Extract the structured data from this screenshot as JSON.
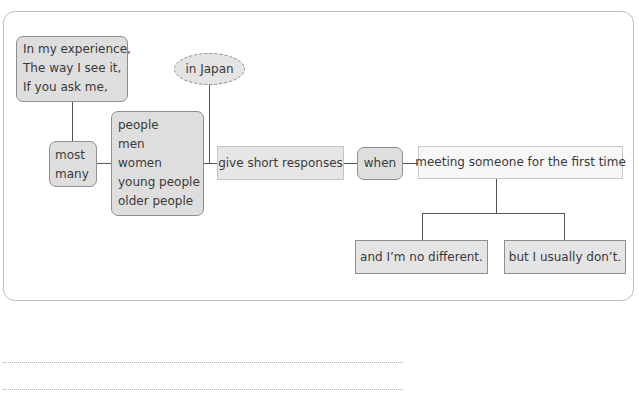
{
  "diagram": {
    "opinion_phrases": [
      "In my experience,",
      "The way I see it,",
      "If you ask me,"
    ],
    "quantifiers": [
      "most",
      "many"
    ],
    "subjects": [
      "people",
      "men",
      "women",
      "young people",
      "older people"
    ],
    "place": "in Japan",
    "verb_phrase": "give short responses",
    "connector": "when",
    "situation": "meeting someone for the first time",
    "endings": [
      "and I’m no different.",
      "but I usually don’t."
    ]
  },
  "answer_lines": 2
}
